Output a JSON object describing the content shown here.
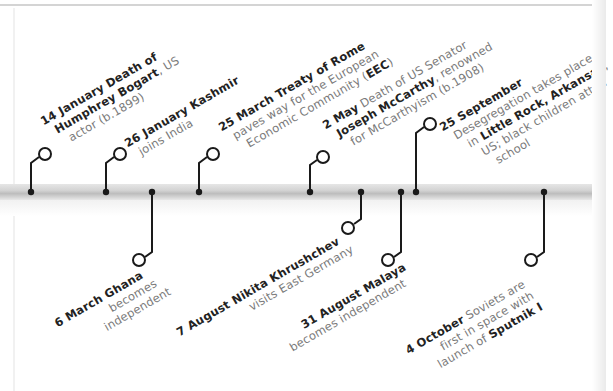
{
  "timeline": {
    "bar_color": "#cccccc",
    "connector_color": "#1a1a1a",
    "events": [
      {
        "id": "14-january",
        "position": "above",
        "date": "14 January",
        "lines": [
          {
            "parts": [
              {
                "text": "14 January",
                "bold": true
              },
              {
                "text": " ",
                "bold": false
              },
              {
                "text": "Death of",
                "bold": true
              }
            ]
          },
          {
            "parts": [
              {
                "text": "Humphrey Bogart",
                "bold": true
              },
              {
                "text": ", US",
                "bold": false
              }
            ]
          },
          {
            "parts": [
              {
                "text": "actor (b.1899)",
                "bold": false
              }
            ]
          }
        ]
      },
      {
        "id": "26-january",
        "position": "above",
        "date": "26 January",
        "lines": [
          {
            "parts": [
              {
                "text": "26 January",
                "bold": true
              },
              {
                "text": " ",
                "bold": false
              },
              {
                "text": "Kashmir",
                "bold": true
              }
            ]
          },
          {
            "parts": [
              {
                "text": "joins India",
                "bold": false
              }
            ]
          }
        ]
      },
      {
        "id": "6-march",
        "position": "below",
        "date": "6 March",
        "lines": [
          {
            "parts": [
              {
                "text": "6 March",
                "bold": true
              },
              {
                "text": " Ghana",
                "bold": true
              }
            ]
          },
          {
            "parts": [
              {
                "text": "becomes",
                "bold": false
              }
            ]
          },
          {
            "parts": [
              {
                "text": "independent",
                "bold": false
              }
            ]
          }
        ]
      },
      {
        "id": "25-march",
        "position": "above",
        "date": "25 March",
        "lines": [
          {
            "parts": [
              {
                "text": "25 March",
                "bold": true
              },
              {
                "text": " Treaty of Rome",
                "bold": true
              }
            ]
          },
          {
            "parts": [
              {
                "text": "paves way for the European",
                "bold": false
              }
            ]
          },
          {
            "parts": [
              {
                "text": "Economic Community (",
                "bold": false
              },
              {
                "text": "EEC",
                "bold": true
              },
              {
                "text": ")",
                "bold": false
              }
            ]
          }
        ]
      },
      {
        "id": "2-may",
        "position": "above",
        "date": "2 May",
        "lines": [
          {
            "parts": [
              {
                "text": "2 May",
                "bold": true
              },
              {
                "text": " Death of US Senator",
                "bold": false
              }
            ]
          },
          {
            "parts": [
              {
                "text": "Joseph McCarthy",
                "bold": true
              },
              {
                "text": ", renowned",
                "bold": false
              }
            ]
          },
          {
            "parts": [
              {
                "text": "for McCarthyism (b.1908)",
                "bold": false
              }
            ]
          }
        ]
      },
      {
        "id": "7-august",
        "position": "below",
        "date": "7 August",
        "lines": [
          {
            "parts": [
              {
                "text": "7 August",
                "bold": true
              },
              {
                "text": " Nikita Khrushchev",
                "bold": true
              }
            ]
          },
          {
            "parts": [
              {
                "text": "visits East Germany",
                "bold": false
              }
            ]
          }
        ]
      },
      {
        "id": "31-august",
        "position": "below",
        "date": "31 August",
        "lines": [
          {
            "parts": [
              {
                "text": "31 August",
                "bold": true
              },
              {
                "text": " Malaya",
                "bold": true
              }
            ]
          },
          {
            "parts": [
              {
                "text": "becomes independent",
                "bold": false
              }
            ]
          }
        ]
      },
      {
        "id": "25-september",
        "position": "above",
        "date": "25 September",
        "lines": [
          {
            "parts": [
              {
                "text": "25 September",
                "bold": true
              }
            ]
          },
          {
            "parts": [
              {
                "text": "Desegregation takes place",
                "bold": false
              }
            ]
          },
          {
            "parts": [
              {
                "text": "in ",
                "bold": false
              },
              {
                "text": "Little Rock, Arkansas",
                "bold": true
              },
              {
                "text": ",",
                "bold": false
              }
            ]
          },
          {
            "parts": [
              {
                "text": "US; black children atten",
                "bold": false
              }
            ]
          },
          {
            "parts": [
              {
                "text": "school",
                "bold": false
              }
            ]
          }
        ]
      },
      {
        "id": "4-october",
        "position": "below",
        "date": "4 October",
        "lines": [
          {
            "parts": [
              {
                "text": "4 October",
                "bold": true
              },
              {
                "text": " Soviets are",
                "bold": false
              }
            ]
          },
          {
            "parts": [
              {
                "text": "first in space with",
                "bold": false
              }
            ]
          },
          {
            "parts": [
              {
                "text": "launch of ",
                "bold": false
              },
              {
                "text": "Sputnik I",
                "bold": true
              }
            ]
          }
        ]
      }
    ]
  }
}
